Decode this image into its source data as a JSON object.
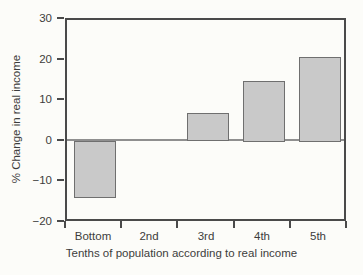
{
  "figure": {
    "background": "#fcfcf9"
  },
  "chart_data": {
    "type": "bar",
    "categories": [
      "Bottom",
      "2nd",
      "3rd",
      "4th",
      "5th"
    ],
    "values": [
      -14,
      0,
      7,
      15,
      21
    ],
    "title": "",
    "xlabel": "Tenths of population according to real income",
    "ylabel": "% Change in real income",
    "ylim": [
      -20,
      30
    ],
    "yticks": [
      30,
      20,
      10,
      0,
      -10,
      -20
    ],
    "grid": false,
    "legend": "none",
    "bar_fill": "#c9c9c9",
    "bar_border": "#6f6f6f",
    "axis_color": "#4a4a4a",
    "zero_line_color": "#8f8f8f",
    "text_color": "#3c3c3c"
  }
}
